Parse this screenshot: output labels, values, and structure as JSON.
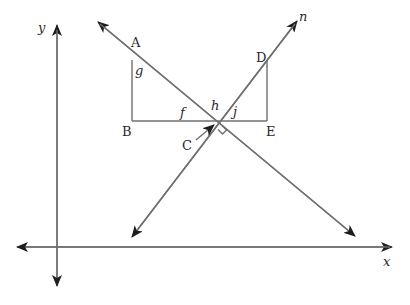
{
  "diagram": {
    "type": "coordinate-geometry-figure",
    "line_color": "#6f6f6f",
    "arrow_color": "#1e1e1e",
    "axes": {
      "x_label": "x",
      "y_label": "y"
    },
    "points": {
      "A": "A",
      "B": "B",
      "C": "C",
      "D": "D",
      "E": "E"
    },
    "angles": {
      "f": "f",
      "g": "g",
      "h": "h",
      "j": "j"
    },
    "line_label": "n",
    "right_angle_at": "C"
  }
}
